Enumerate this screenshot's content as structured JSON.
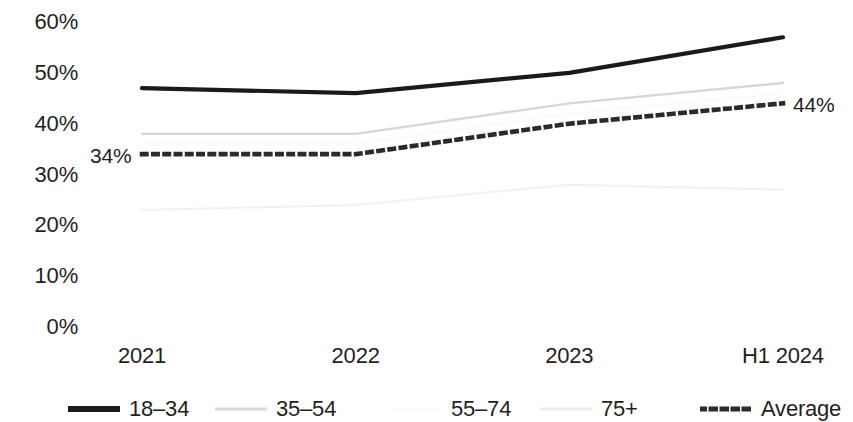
{
  "chart_data": {
    "type": "line",
    "title": "",
    "subtitle": "",
    "xlabel": "",
    "ylabel": "",
    "categories": [
      "2021",
      "2022",
      "2023",
      "H1 2024"
    ],
    "ylim": [
      0,
      60
    ],
    "yticks": [
      0,
      10,
      20,
      30,
      40,
      50,
      60
    ],
    "ytick_labels": [
      "0%",
      "10%",
      "20%",
      "30%",
      "40%",
      "50%",
      "60%"
    ],
    "grid": false,
    "legend_position": "bottom",
    "series": [
      {
        "name": "18–34",
        "values": [
          47,
          46,
          50,
          57
        ],
        "color": "#1a1a1a",
        "style": "solid",
        "width": 4.2
      },
      {
        "name": "35–54",
        "values": [
          38,
          38,
          44,
          48
        ],
        "color": "#d6d6d6",
        "style": "solid",
        "width": 2.4
      },
      {
        "name": "55–74",
        "values": [
          36,
          36,
          42,
          46
        ],
        "color": "#fafafa",
        "style": "solid",
        "width": 2.0
      },
      {
        "name": "75+",
        "values": [
          23,
          24,
          28,
          27
        ],
        "color": "#f1f1f1",
        "style": "solid",
        "width": 2.0
      },
      {
        "name": "Average",
        "values": [
          34,
          34,
          40,
          44
        ],
        "color": "#2b2b2b",
        "style": "dotted",
        "width": 4.6
      }
    ],
    "annotations": [
      {
        "text": "34%",
        "series": "Average",
        "category": "2021",
        "value": 34,
        "position": "left"
      },
      {
        "text": "44%",
        "series": "Average",
        "category": "H1 2024",
        "value": 44,
        "position": "right"
      }
    ]
  },
  "axes": {
    "y_ticks": [
      {
        "label": "60%",
        "value": 60
      },
      {
        "label": "50%",
        "value": 50
      },
      {
        "label": "40%",
        "value": 40
      },
      {
        "label": "30%",
        "value": 30
      },
      {
        "label": "20%",
        "value": 20
      },
      {
        "label": "10%",
        "value": 10
      },
      {
        "label": "0%",
        "value": 0
      }
    ],
    "x_ticks": [
      {
        "label": "2021"
      },
      {
        "label": "2022"
      },
      {
        "label": "2023"
      },
      {
        "label": "H1 2024"
      }
    ]
  },
  "legend": {
    "items": [
      {
        "label": "18–34",
        "color": "#1a1a1a",
        "style": "solid",
        "width": 6
      },
      {
        "label": "35–54",
        "color": "#d9d9d9",
        "style": "solid",
        "width": 3
      },
      {
        "label": "55–74",
        "color": "#fbfbfb",
        "style": "solid",
        "width": 3
      },
      {
        "label": "75+",
        "color": "#ededed",
        "style": "solid",
        "width": 3
      },
      {
        "label": "Average",
        "color": "#2b2b2b",
        "style": "dotted",
        "width": 5
      }
    ]
  },
  "annotations": {
    "left_value": "34%",
    "right_value": "44%"
  },
  "colors": {
    "text": "#231f20",
    "background": "#ffffff",
    "accent_dark": "#1a1a1a"
  }
}
